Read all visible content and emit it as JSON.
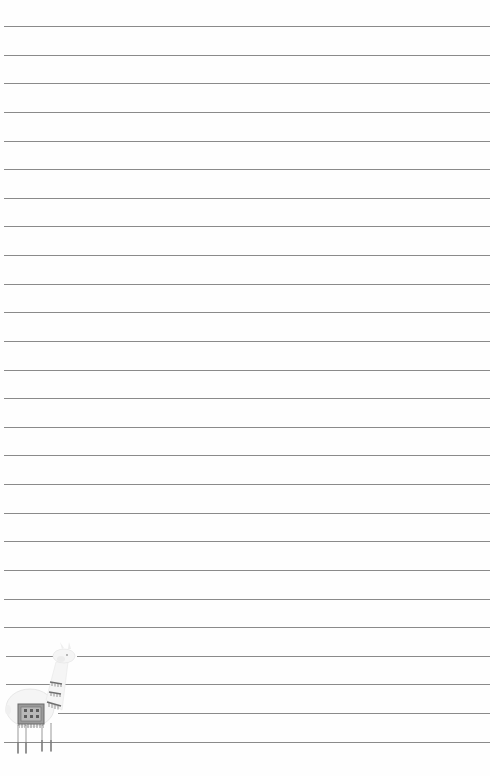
{
  "page": {
    "type": "lined-notebook-page",
    "background_color": "#fefefe",
    "line_color": "#8a8a8a",
    "line_count": 26,
    "line_first_y": 26,
    "line_spacing": 28.63,
    "line_left_x": 4,
    "line_right_x": 490
  },
  "decoration": {
    "icon": "llama-illustration-icon",
    "position": "bottom-left",
    "colors": {
      "body": "#f4f4f4",
      "outline": "#d8d8d8",
      "blanket": "#8c8c8c",
      "pattern": "#5a5a5a",
      "tassels": "#6f6f6f"
    }
  }
}
